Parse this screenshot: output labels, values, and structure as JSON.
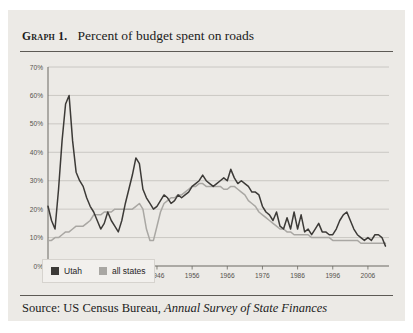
{
  "figure": {
    "caption_label": "Graph 1.",
    "caption_text": "Percent of budget spent on roads",
    "source_prefix": "Source: US Census Bureau,",
    "source_italic": "Annual Survey of State Finances"
  },
  "legend": {
    "items": [
      {
        "label": "Utah",
        "color": "#3c3a37"
      },
      {
        "label": "all states",
        "color": "#a9a7a3"
      }
    ]
  },
  "colors": {
    "card_background": "#eceae6",
    "plot_background": "#eceae6",
    "gridline": "#c2bfba",
    "axis": "#6b6862",
    "utah": "#3c3a37",
    "all_states": "#a9a7a3",
    "text": "#1b1b1b",
    "tick_text": "#55524d"
  },
  "chart_data": {
    "type": "line",
    "title": "Percent of budget spent on roads",
    "xlabel": "",
    "ylabel": "",
    "xlim": [
      1915,
      2012
    ],
    "ylim": [
      0,
      70
    ],
    "grid": true,
    "legend_position": "bottom-left",
    "ytick_labels": [
      "0%",
      "10%",
      "20%",
      "30%",
      "40%",
      "50%",
      "60%",
      "70%"
    ],
    "ytick_values": [
      0,
      10,
      20,
      30,
      40,
      50,
      60,
      70
    ],
    "xtick_labels": [
      "1916",
      "1926",
      "1936",
      "1946",
      "1956",
      "1966",
      "1976",
      "1986",
      "1996",
      "2006"
    ],
    "xtick_values": [
      1916,
      1926,
      1936,
      1946,
      1956,
      1966,
      1976,
      1986,
      1996,
      2006
    ],
    "x": [
      1915,
      1916,
      1917,
      1918,
      1919,
      1920,
      1921,
      1922,
      1923,
      1924,
      1925,
      1926,
      1927,
      1928,
      1929,
      1930,
      1931,
      1932,
      1933,
      1934,
      1935,
      1936,
      1937,
      1938,
      1939,
      1940,
      1941,
      1942,
      1943,
      1944,
      1945,
      1946,
      1947,
      1948,
      1949,
      1950,
      1951,
      1952,
      1953,
      1954,
      1955,
      1956,
      1957,
      1958,
      1959,
      1960,
      1961,
      1962,
      1963,
      1964,
      1965,
      1966,
      1967,
      1968,
      1969,
      1970,
      1971,
      1972,
      1973,
      1974,
      1975,
      1976,
      1977,
      1978,
      1979,
      1980,
      1981,
      1982,
      1983,
      1984,
      1985,
      1986,
      1987,
      1988,
      1989,
      1990,
      1991,
      1992,
      1993,
      1994,
      1995,
      1996,
      1997,
      1998,
      1999,
      2000,
      2001,
      2002,
      2003,
      2004,
      2005,
      2006,
      2007,
      2008,
      2009,
      2010,
      2011
    ],
    "series": [
      {
        "name": "Utah",
        "color": "#3c3a37",
        "values": [
          21,
          16,
          13,
          27,
          44,
          57,
          60,
          44,
          33,
          30,
          28,
          24,
          21,
          19,
          16,
          13,
          15,
          19,
          16,
          14,
          12,
          16,
          22,
          27,
          32,
          38,
          36,
          27,
          24,
          22,
          20,
          21,
          23,
          25,
          24,
          22,
          23,
          25,
          24,
          25,
          26,
          28,
          29,
          30,
          32,
          30,
          29,
          28,
          29,
          30,
          31,
          30,
          34,
          31,
          29,
          30,
          29,
          28,
          26,
          26,
          25,
          21,
          19,
          18,
          16,
          19,
          14,
          13,
          17,
          13,
          19,
          13,
          18,
          12,
          13,
          11,
          13,
          15,
          12,
          12,
          11,
          11,
          13,
          16,
          18,
          19,
          16,
          13,
          11,
          10,
          9,
          10,
          9,
          11,
          11,
          10,
          7
        ]
      },
      {
        "name": "all states",
        "color": "#a9a7a3",
        "values": [
          9,
          9,
          10,
          10,
          11,
          12,
          12,
          13,
          14,
          14,
          14,
          15,
          16,
          18,
          18,
          18,
          19,
          19,
          19,
          20,
          20,
          20,
          20,
          20,
          20,
          21,
          22,
          20,
          13,
          9,
          9,
          14,
          19,
          22,
          23,
          24,
          24,
          25,
          25,
          26,
          27,
          28,
          28,
          29,
          29,
          28,
          28,
          28,
          28,
          28,
          27,
          27,
          28,
          28,
          27,
          26,
          25,
          23,
          22,
          21,
          19,
          18,
          17,
          16,
          15,
          14,
          13,
          13,
          12,
          12,
          11,
          11,
          11,
          11,
          11,
          10,
          10,
          10,
          10,
          10,
          10,
          9,
          9,
          9,
          9,
          9,
          9,
          9,
          9,
          8,
          8,
          8,
          8,
          8,
          8,
          8,
          8
        ]
      }
    ]
  }
}
